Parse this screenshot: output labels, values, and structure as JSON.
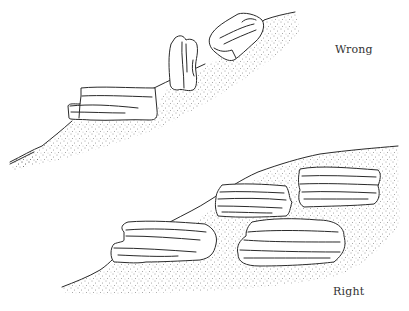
{
  "figure": {
    "panels": [
      {
        "id": "wrong",
        "label": "Wrong",
        "description": "Rocks set upright or perched on top of the slope surface"
      },
      {
        "id": "right",
        "label": "Right",
        "description": "Flat layered rocks bedded horizontally into the slope"
      }
    ]
  },
  "colors": {
    "ink": "#2a2a2a",
    "paper": "#ffffff",
    "stipple": "#3a3a3a"
  }
}
